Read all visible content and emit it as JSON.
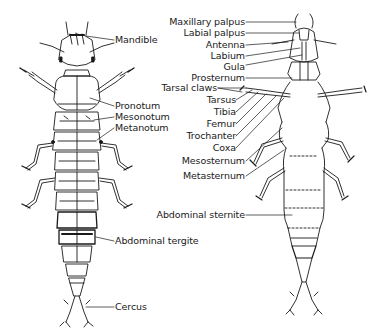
{
  "figure": {
    "views": [
      {
        "id": "dorsal",
        "name": "Dorsal view"
      },
      {
        "id": "ventral",
        "name": "Ventral view"
      }
    ],
    "line_color": "#1a1a1a",
    "background": "#ffffff"
  },
  "dorsal_labels": {
    "mandible": "Mandible",
    "pronotum": "Pronotum",
    "mesonotum": "Mesonotum",
    "metanotum": "Metanotum",
    "abdominal_tergite": "Abdominal tergite",
    "cercus": "Cercus"
  },
  "ventral_labels": {
    "maxillary_palpus": "Maxillary palpus",
    "labial_palpus": "Labial palpus",
    "antenna": "Antenna",
    "labium": "Labium",
    "gula": "Gula",
    "prosternum": "Prosternum",
    "tarsal_claws": "Tarsal claws",
    "tarsus": "Tarsus",
    "tibia": "Tibia",
    "femur": "Femur",
    "trochanter": "Trochanter",
    "coxa": "Coxa",
    "mesosternum": "Mesosternum",
    "metasternum": "Metasternum",
    "abdominal_sternite": "Abdominal sternite"
  }
}
